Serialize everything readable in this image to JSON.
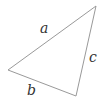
{
  "diagram": {
    "type": "triangle",
    "vertices": [
      [
        96,
        6
      ],
      [
        8,
        70
      ],
      [
        76,
        96
      ]
    ],
    "stroke": "#999999",
    "labels": {
      "a": "a",
      "b": "b",
      "c": "c"
    }
  }
}
